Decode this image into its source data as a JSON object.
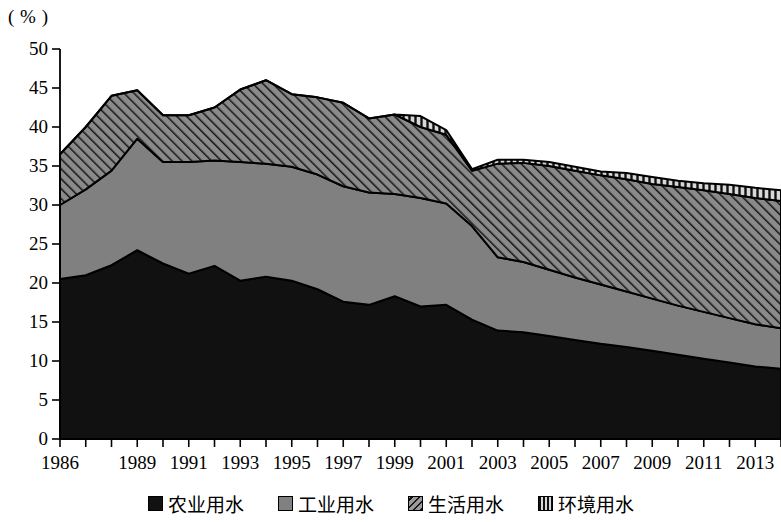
{
  "chart_data": {
    "type": "area",
    "stacked": true,
    "title": "",
    "subtitle": "",
    "xlabel": "",
    "ylabel": "",
    "unit_label": "( % )",
    "ylim": [
      0,
      50
    ],
    "ytick_values": [
      0,
      5,
      10,
      15,
      20,
      25,
      30,
      35,
      40,
      45,
      50
    ],
    "ytick_labels": [
      "0",
      "5",
      "10",
      "15",
      "20",
      "25",
      "30",
      "35",
      "40",
      "45",
      "50"
    ],
    "grid": false,
    "legend_position": "bottom",
    "x": [
      1986,
      1987,
      1988,
      1989,
      1990,
      1991,
      1992,
      1993,
      1994,
      1995,
      1996,
      1997,
      1998,
      1999,
      2000,
      2001,
      2002,
      2003,
      2004,
      2005,
      2006,
      2007,
      2008,
      2009,
      2010,
      2011,
      2012,
      2013,
      2014
    ],
    "xtick_labels": [
      "1986",
      "1989",
      "1991",
      "1993",
      "1995",
      "1997",
      "1999",
      "2001",
      "2003",
      "2005",
      "2007",
      "2009",
      "2011",
      "2013"
    ],
    "xtick_values": [
      1986,
      1989,
      1991,
      1993,
      1995,
      1997,
      1999,
      2001,
      2003,
      2005,
      2007,
      2009,
      2011,
      2013
    ],
    "series": [
      {
        "name": "农业用水",
        "pattern": "solid-black",
        "color": "#111111",
        "values": [
          20.5,
          21.0,
          22.3,
          24.2,
          22.5,
          21.2,
          22.2,
          20.3,
          20.8,
          20.3,
          19.2,
          17.6,
          17.2,
          18.3,
          17.0,
          17.2,
          15.3,
          13.9,
          13.7,
          13.2,
          12.7,
          12.2,
          11.8,
          11.3,
          10.8,
          10.3,
          9.8,
          9.3,
          9.0
        ]
      },
      {
        "name": "工业用水",
        "pattern": "solid-gray",
        "color": "#808080",
        "values": [
          9.5,
          11.0,
          12.1,
          14.3,
          13.0,
          14.3,
          13.5,
          15.2,
          14.5,
          14.6,
          14.7,
          14.8,
          14.4,
          13.1,
          13.9,
          13.0,
          12.0,
          9.4,
          9.0,
          8.5,
          8.0,
          7.6,
          7.1,
          6.7,
          6.3,
          6.0,
          5.7,
          5.4,
          5.2
        ]
      },
      {
        "name": "生活用水",
        "pattern": "diagonal-hatch",
        "color": "#8a8a8a",
        "values": [
          6.5,
          8.0,
          9.6,
          6.2,
          6.0,
          6.0,
          6.8,
          9.3,
          10.7,
          9.3,
          9.9,
          10.7,
          9.5,
          10.2,
          9.1,
          8.8,
          7.1,
          12.0,
          12.7,
          13.3,
          13.7,
          14.0,
          14.4,
          14.7,
          15.2,
          15.6,
          15.9,
          16.2,
          16.3
        ]
      },
      {
        "name": "环境用水",
        "pattern": "vertical-hatch",
        "color": "#5a5a5a",
        "values": [
          0,
          0,
          0,
          0,
          0,
          0,
          0,
          0,
          0,
          0,
          0,
          0,
          0,
          0,
          1.4,
          0.6,
          0.2,
          0.5,
          0.4,
          0.5,
          0.5,
          0.5,
          0.8,
          0.9,
          0.8,
          0.9,
          1.2,
          1.3,
          1.4
        ]
      }
    ],
    "totals": [
      36.5,
      40.0,
      44.0,
      44.7,
      41.5,
      41.5,
      42.5,
      44.8,
      46.0,
      44.2,
      43.8,
      43.1,
      41.1,
      41.6,
      41.4,
      39.6,
      34.6,
      35.8,
      35.8,
      35.5,
      34.9,
      34.3,
      34.1,
      33.6,
      33.1,
      32.8,
      32.6,
      32.2,
      31.9
    ]
  },
  "legend": {
    "items": [
      {
        "label": "农业用水",
        "swatch": "solid-black"
      },
      {
        "label": "工业用水",
        "swatch": "solid-gray"
      },
      {
        "label": "生活用水",
        "swatch": "diagonal-hatch"
      },
      {
        "label": "环境用水",
        "swatch": "vertical-hatch"
      }
    ]
  },
  "colors": {
    "agriculture": "#111111",
    "industry": "#808080",
    "domestic": "#8a8a8a",
    "environment": "#5a5a5a",
    "axis": "#000000",
    "background": "#ffffff"
  }
}
